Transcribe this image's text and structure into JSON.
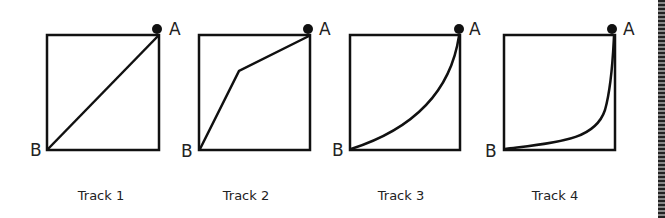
{
  "figure": {
    "tracks": [
      {
        "label": "Track 1",
        "start_label": "A",
        "end_label": "B",
        "shape": "straight diagonal line"
      },
      {
        "label": "Track 2",
        "start_label": "A",
        "end_label": "B",
        "shape": "two-segment line with bend"
      },
      {
        "label": "Track 3",
        "start_label": "A",
        "end_label": "B",
        "shape": "concave-up curve"
      },
      {
        "label": "Track 4",
        "start_label": "A",
        "end_label": "B",
        "shape": "steep drop then flat curve"
      }
    ],
    "colors": {
      "line": "#111111",
      "background": "#ffffff"
    }
  }
}
